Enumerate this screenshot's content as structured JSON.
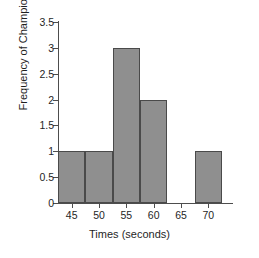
{
  "chart_data": {
    "type": "bar",
    "title": "",
    "xlabel": "Times (seconds)",
    "ylabel": "Frequency of Champions",
    "categories": [
      "45",
      "50",
      "55",
      "60",
      "65",
      "70"
    ],
    "bin_edges": [
      42.5,
      47.5,
      52.5,
      57.5,
      62.5,
      67.5,
      72.5
    ],
    "values": [
      1,
      1,
      3,
      2,
      0,
      1
    ],
    "bin_centers": [
      45,
      50,
      55,
      60,
      65,
      70
    ],
    "xlim": [
      42.5,
      72.5
    ],
    "ylim": [
      0,
      3.5
    ],
    "xticks": [
      45,
      50,
      55,
      60,
      65,
      70
    ],
    "yticks": [
      0,
      0.5,
      1,
      1.5,
      2,
      2.5,
      3,
      3.5
    ],
    "xtick_labels": [
      "45",
      "50",
      "55",
      "60",
      "65",
      "70"
    ],
    "ytick_labels": [
      "0",
      "0.5",
      "1",
      "1.5",
      "2",
      "2.5",
      "3",
      "3.5"
    ],
    "grid": false,
    "legend": false,
    "bar_color": "#8f8f8f",
    "bar_edge_color": "#4a4a4a",
    "axis_color": "#4d4d4d",
    "background_color": "#ffffff"
  }
}
